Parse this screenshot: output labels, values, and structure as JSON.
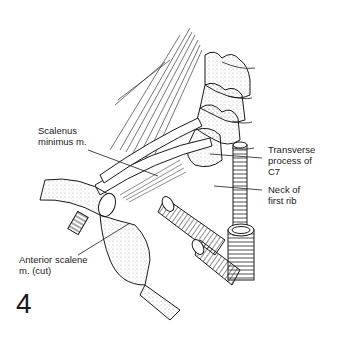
{
  "figure": {
    "number": "4"
  },
  "labels": {
    "scalenus_minimus": {
      "line1": "Scalenus",
      "line2": "minimus m."
    },
    "transverse_process": {
      "line1": "Transverse",
      "line2": "process of",
      "line3": "C7"
    },
    "neck_first_rib": {
      "line1": "Neck of",
      "line2": "first rib"
    },
    "anterior_scalene": {
      "line1": "Anterior scalene",
      "line2": "m. (cut)"
    }
  },
  "colors": {
    "ink": "#1a1a1a",
    "stipple": "#9a9a9a",
    "background": "#ffffff"
  }
}
